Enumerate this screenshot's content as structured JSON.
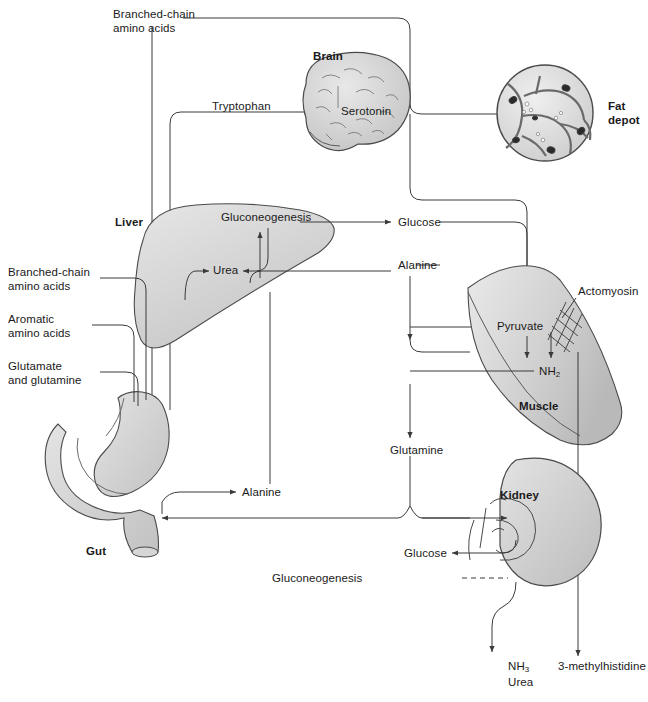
{
  "diagram": {
    "type": "flow-diagram",
    "background": "#ffffff",
    "stroke": "#3a3a3a",
    "text_color": "#1a1a1a"
  },
  "organs": [
    {
      "id": "brain",
      "label": "Brain",
      "x": 313,
      "y": 56,
      "fill": "#d2d2d2"
    },
    {
      "id": "fat",
      "label": "Fat\ndepot",
      "x": 608,
      "y": 106,
      "fill": "#cccccc"
    },
    {
      "id": "liver",
      "label": "Liver",
      "x": 115,
      "y": 222,
      "fill": "#d8d8d8"
    },
    {
      "id": "muscle",
      "label": "Muscle",
      "x": 519,
      "y": 406,
      "fill": "#d4d4d4"
    },
    {
      "id": "gut",
      "label": "Gut",
      "x": 86,
      "y": 551,
      "fill": "#cfcfcf"
    },
    {
      "id": "kidney",
      "label": "Kidney",
      "x": 500,
      "y": 495,
      "fill": "#c9c9c9"
    }
  ],
  "metabolites": [
    {
      "id": "bcaa-top",
      "label": "Branched-chain\namino acids",
      "x": 113,
      "y": 8,
      "align": "left"
    },
    {
      "id": "tryptophan",
      "label": "Tryptophan",
      "x": 212,
      "y": 106,
      "align": "left"
    },
    {
      "id": "serotonin",
      "label": "Serotonin",
      "x": 341,
      "y": 111,
      "align": "left"
    },
    {
      "id": "gluconeo-liver",
      "label": "Gluconeogenesis",
      "x": 221,
      "y": 217,
      "align": "left"
    },
    {
      "id": "glucose-liver",
      "label": "Glucose",
      "x": 398,
      "y": 222,
      "align": "left"
    },
    {
      "id": "urea-liver",
      "label": "Urea",
      "x": 213,
      "y": 265,
      "align": "left"
    },
    {
      "id": "alanine-mid",
      "label": "Alanine",
      "x": 398,
      "y": 265,
      "align": "left"
    },
    {
      "id": "bcaa-left",
      "label": "Branched-chain\namino acids",
      "x": 8,
      "y": 266,
      "align": "left"
    },
    {
      "id": "aromatic",
      "label": "Aromatic\namino acids",
      "x": 8,
      "y": 313,
      "align": "left"
    },
    {
      "id": "glutamate",
      "label": "Glutamate\nand glutamine",
      "x": 8,
      "y": 360,
      "align": "left"
    },
    {
      "id": "pyruvate",
      "label": "Pyruvate",
      "x": 497,
      "y": 321,
      "align": "left"
    },
    {
      "id": "actomyosin",
      "label": "Actomyosin",
      "x": 578,
      "y": 291,
      "align": "left"
    },
    {
      "id": "nh2",
      "label": "NH",
      "sub": "2",
      "x": 539,
      "y": 366,
      "align": "left"
    },
    {
      "id": "glutamine",
      "label": "Glutamine",
      "x": 390,
      "y": 446,
      "align": "left"
    },
    {
      "id": "alanine-gut",
      "label": "Alanine",
      "x": 242,
      "y": 491,
      "align": "left"
    },
    {
      "id": "glucose-kid",
      "label": "Glucose",
      "x": 404,
      "y": 548,
      "align": "left"
    },
    {
      "id": "gluconeo-kid",
      "label": "Gluconeogenesis",
      "x": 380,
      "y": 573,
      "align": "right"
    },
    {
      "id": "nh3",
      "label": "NH",
      "sub": "3",
      "x": 508,
      "y": 665,
      "align": "left"
    },
    {
      "id": "urea-bottom",
      "label": "Urea",
      "x": 508,
      "y": 679,
      "align": "left"
    },
    {
      "id": "methylhist",
      "label": "3-methylhistidine",
      "x": 558,
      "y": 665,
      "align": "left"
    }
  ],
  "flows": [
    {
      "from": "bcaa-top",
      "to": "fat-depot-line",
      "kind": "solid"
    },
    {
      "from": "tryptophan",
      "to": "brain",
      "kind": "solid"
    },
    {
      "from": "brain",
      "to": "serotonin",
      "kind": "solid"
    },
    {
      "from": "gluconeogenesis-liver",
      "to": "glucose",
      "kind": "solid"
    },
    {
      "from": "alanine",
      "to": "urea",
      "kind": "solid"
    },
    {
      "from": "glucose",
      "to": "pyruvate",
      "kind": "solid"
    },
    {
      "from": "pyruvate",
      "to": "alanine",
      "kind": "solid"
    },
    {
      "from": "muscle",
      "to": "glutamine",
      "kind": "solid"
    },
    {
      "from": "gut",
      "to": "alanine-gut",
      "kind": "solid"
    },
    {
      "from": "glutamine",
      "to": "kidney",
      "kind": "solid"
    },
    {
      "from": "kidney",
      "to": "glucose-kidney",
      "kind": "solid"
    },
    {
      "from": "gluconeogenesis-kidney",
      "to": "kidney",
      "kind": "dashed"
    },
    {
      "from": "kidney",
      "to": "nh3-urea",
      "kind": "solid"
    },
    {
      "from": "muscle",
      "to": "3-methylhistidine",
      "kind": "solid"
    }
  ]
}
